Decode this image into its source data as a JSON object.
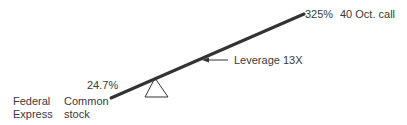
{
  "diagram": {
    "type": "lever-seesaw",
    "left_labels": {
      "company_line1": "Federal",
      "company_line2": "Express",
      "instrument_line1": "Common",
      "instrument_line2": "stock",
      "return": "24.7%"
    },
    "right_labels": {
      "return": "325%",
      "instrument": "40 Oct. call"
    },
    "annotation": {
      "label": "Leverage 13X"
    },
    "colors": {
      "beam": "#333333",
      "text": "#3a3a3a"
    }
  }
}
